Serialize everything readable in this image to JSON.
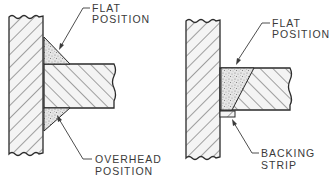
{
  "figures": [
    {
      "id": "left",
      "description": "T-joint with fillet welds on both sides",
      "labels": {
        "top": [
          "FLAT",
          "POSITION"
        ],
        "bottom": [
          "OVERHEAD",
          "POSITION"
        ]
      }
    },
    {
      "id": "right",
      "description": "T-joint with single bevel groove weld and backing strip",
      "labels": {
        "top": [
          "FLAT",
          "POSITION"
        ],
        "bottom": [
          "BACKING",
          "STRIP"
        ]
      }
    }
  ],
  "colors": {
    "line": "#2a2a2a",
    "hatch": "#4a4a4a",
    "stipple": "#8a8a8a",
    "stipple_bg": "#e8e8e8",
    "text": "#3a3a3a"
  }
}
